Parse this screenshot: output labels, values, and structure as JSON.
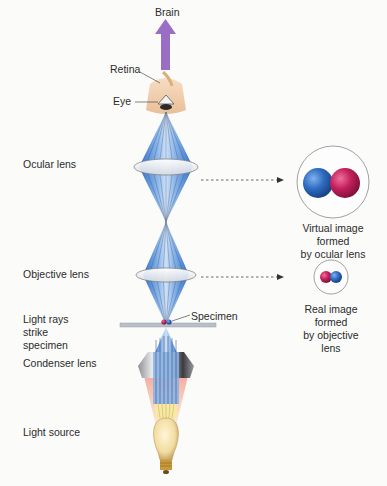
{
  "diagram": {
    "labels": {
      "brain": "Brain",
      "retina": "Retina",
      "eye": "Eye",
      "ocular_lens": "Ocular lens",
      "objective_lens": "Objective lens",
      "light_rays_line1": "Light rays",
      "light_rays_line2": "strike",
      "light_rays_line3": "specimen",
      "specimen": "Specimen",
      "condenser_lens": "Condenser lens",
      "light_source": "Light source"
    },
    "images": {
      "virtual": {
        "line1": "Virtual image",
        "line2": "formed",
        "line3": "by ocular lens"
      },
      "real": {
        "line1": "Real image",
        "line2": "formed",
        "line3": "by objective",
        "line4": "lens"
      }
    },
    "colors": {
      "ray_blue": "#3d7fd0",
      "ray_light": "#a9c9ef",
      "brain_arrow": "#9a6cc4",
      "sphere_blue": "#2f6dbf",
      "sphere_red": "#c4205e",
      "lamp_glow": "#f3b6a6",
      "skin": "#f0cfae"
    }
  }
}
